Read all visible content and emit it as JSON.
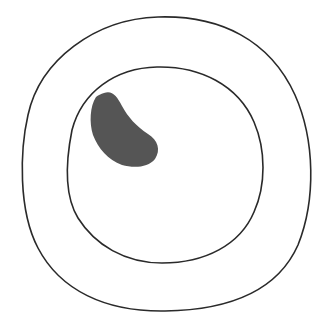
{
  "diagram": {
    "background": "#ffffff",
    "stroke_color": "#2a2a2a",
    "fill_color": "#555555",
    "shapes": [
      {
        "name": "outer-ring",
        "type": "closed-curve",
        "fill": "none"
      },
      {
        "name": "inner-ring",
        "type": "closed-curve",
        "fill": "none"
      },
      {
        "name": "dark-blob",
        "type": "kidney-shape",
        "fill": "#555555"
      }
    ]
  }
}
